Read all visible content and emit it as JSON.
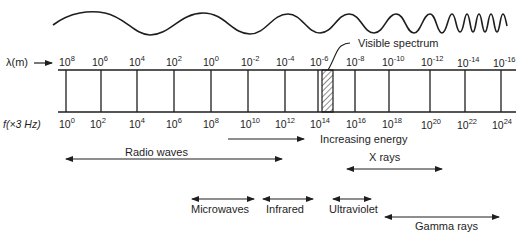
{
  "diagram": {
    "title_clipped": "Figure: electromagnetic spectrum",
    "wavelength_row": {
      "label": "λ(m)",
      "arrow_glyph": "→",
      "ticks": [
        {
          "base": "10",
          "exp": "8"
        },
        {
          "base": "10",
          "exp": "6"
        },
        {
          "base": "10",
          "exp": "4"
        },
        {
          "base": "10",
          "exp": "2"
        },
        {
          "base": "10",
          "exp": "0"
        },
        {
          "base": "10",
          "exp": "-2"
        },
        {
          "base": "10",
          "exp": "-4"
        },
        {
          "base": "10",
          "exp": "-6"
        },
        {
          "base": "10",
          "exp": "-8"
        },
        {
          "base": "10",
          "exp": "-10"
        },
        {
          "base": "10",
          "exp": "-12"
        },
        {
          "base": "10",
          "exp": "-14"
        },
        {
          "base": "10",
          "exp": "-16"
        }
      ]
    },
    "frequency_row": {
      "label": "f(×3 Hz)",
      "ticks": [
        {
          "base": "10",
          "exp": "0"
        },
        {
          "base": "10",
          "exp": "2"
        },
        {
          "base": "10",
          "exp": "4"
        },
        {
          "base": "10",
          "exp": "6"
        },
        {
          "base": "10",
          "exp": "8"
        },
        {
          "base": "10",
          "exp": "10"
        },
        {
          "base": "10",
          "exp": "12"
        },
        {
          "base": "10",
          "exp": "14"
        },
        {
          "base": "10",
          "exp": "16"
        },
        {
          "base": "10",
          "exp": "18"
        },
        {
          "base": "10",
          "exp": "20"
        },
        {
          "base": "10",
          "exp": "22"
        },
        {
          "base": "10",
          "exp": "24"
        }
      ]
    },
    "visible_spectrum_label": "Visible spectrum",
    "increasing_energy_label": "Increasing energy",
    "bands": {
      "radio": "Radio waves",
      "xrays": "X rays",
      "microwaves": "Microwaves",
      "infrared": "Infrared",
      "ultraviolet": "Ultraviolet",
      "gamma": "Gamma rays"
    },
    "colors": {
      "ink": "#1e1e1e",
      "background": "#ffffff"
    }
  }
}
